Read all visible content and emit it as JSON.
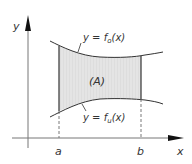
{
  "diagram": {
    "axes": {
      "x_label": "x",
      "y_label": "y"
    },
    "bounds": {
      "a_label": "a",
      "b_label": "b"
    },
    "region_label": "(A)",
    "upper_curve": {
      "prefix": "y = f",
      "subscript": "o",
      "suffix": "(x)"
    },
    "lower_curve": {
      "prefix": "y = f",
      "subscript": "u",
      "suffix": "(x)"
    },
    "colors": {
      "region_fill": "#e2e2e2",
      "curve": "#333333",
      "axis": "#555555",
      "text": "#333333"
    }
  }
}
